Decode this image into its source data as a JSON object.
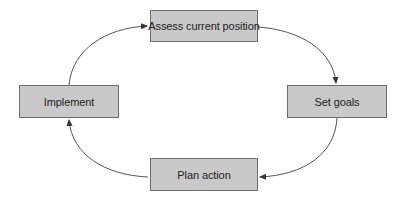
{
  "diagram": {
    "type": "cycle",
    "nodes": [
      {
        "id": "assess",
        "label": "Assess current position"
      },
      {
        "id": "goals",
        "label": "Set goals"
      },
      {
        "id": "plan",
        "label": "Plan action"
      },
      {
        "id": "impl",
        "label": "Implement"
      }
    ],
    "edges": [
      {
        "from": "Assess current position",
        "to": "Set goals"
      },
      {
        "from": "Set goals",
        "to": "Plan action"
      },
      {
        "from": "Plan action",
        "to": "Implement"
      },
      {
        "from": "Implement",
        "to": "Assess current position"
      }
    ],
    "colors": {
      "node_fill": "#c9c9c9",
      "node_border": "#6e6e6e",
      "arrow": "#555555",
      "text": "#222222"
    }
  }
}
